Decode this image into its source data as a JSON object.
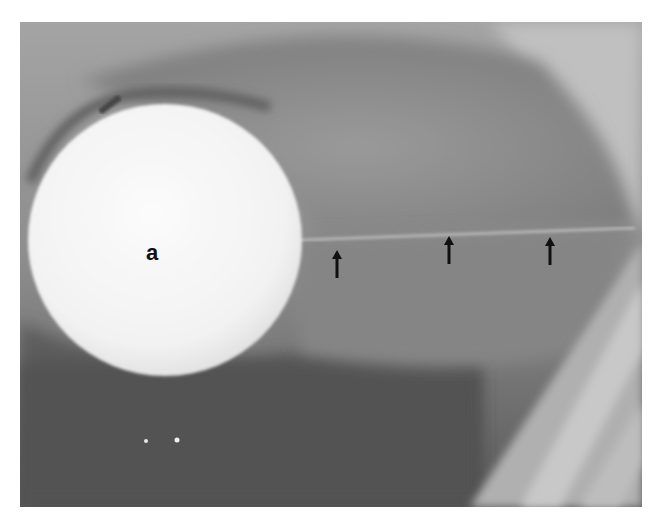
{
  "figure": {
    "type": "radiograph",
    "label": "a",
    "labels": [
      {
        "text": "a",
        "target": "round-radiopaque-object",
        "x": 153,
        "y": 256
      }
    ],
    "arrows": [
      {
        "id": "arrow-1",
        "x": 337,
        "tip_y": 250,
        "direction": "up"
      },
      {
        "id": "arrow-2",
        "x": 449,
        "tip_y": 236,
        "direction": "up"
      },
      {
        "id": "arrow-3",
        "x": 550,
        "tip_y": 237,
        "direction": "up"
      }
    ],
    "colors": {
      "background": "#ffffff",
      "film_mid": "#8e8e8e",
      "film_light": "#b8b8b8",
      "film_dark": "#4a4a4a",
      "object": "#f6f6f6",
      "arrow": "#111111"
    }
  }
}
